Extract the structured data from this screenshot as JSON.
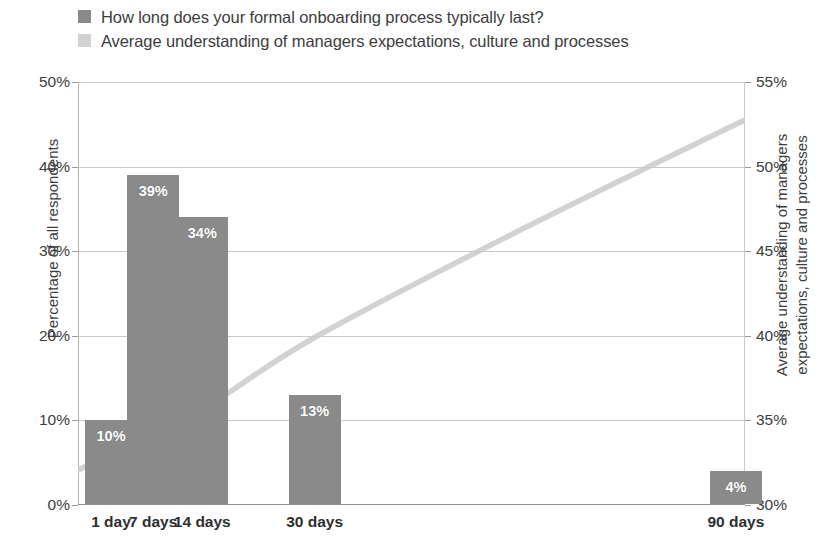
{
  "legend": {
    "items": [
      {
        "label": "How long does your formal onboarding process typically last?",
        "color": "#8a8a8a",
        "swatch": "bar-swatch"
      },
      {
        "label": "Average understanding of managers expectations, culture and processes",
        "color": "#d2d2d2",
        "swatch": "line-swatch"
      }
    ]
  },
  "axes": {
    "y_left": {
      "title": "Percentage of all respondents",
      "ticks": [
        "0%",
        "10%",
        "20%",
        "30%",
        "40%",
        "50%"
      ],
      "values": [
        0,
        10,
        20,
        30,
        40,
        50
      ],
      "min": 0,
      "max": 50
    },
    "y_right": {
      "title_line1": "Average understanding of managers expectations,",
      "title_line2": "culture and processes",
      "title": "Average understanding of managers expectations, culture and processes",
      "ticks": [
        "30%",
        "35%",
        "40%",
        "45%",
        "50%",
        "55%"
      ],
      "values": [
        30,
        35,
        40,
        45,
        50,
        55
      ],
      "min": 30,
      "max": 55
    },
    "x": {
      "ticks": [
        "1 day",
        "7 days",
        "14 days",
        "30 days",
        "90 days"
      ],
      "values": [
        1,
        7,
        14,
        30,
        90
      ]
    }
  },
  "chart_data": {
    "type": "bar",
    "title": "",
    "subtitle": "",
    "xlabel": "",
    "ylabel": "Percentage of all respondents",
    "y2label": "Average understanding of managers expectations, culture and processes",
    "categories": [
      "1 day",
      "7 days",
      "14 days",
      "30 days",
      "90 days"
    ],
    "x": [
      1,
      7,
      14,
      30,
      90
    ],
    "ylim": [
      0,
      50
    ],
    "y2lim": [
      30,
      55
    ],
    "grid": true,
    "legend_position": "top-left",
    "series": [
      {
        "name": "How long does your formal onboarding process typically last?",
        "type": "bar",
        "axis": "left",
        "color": "#8a8a8a",
        "values": [
          10,
          39,
          34,
          13,
          4
        ],
        "data_labels": [
          "10%",
          "39%",
          "34%",
          "13%",
          "4%"
        ]
      },
      {
        "name": "Average understanding of managers expectations, culture and processes",
        "type": "line",
        "axis": "right",
        "color": "#d2d2d2",
        "values": [
          33.0,
          34.2,
          35.6,
          39.9,
          52.5
        ],
        "curve_points": [
          [
            1,
            33.0
          ],
          [
            7,
            34.2
          ],
          [
            14,
            35.6
          ],
          [
            30,
            39.9
          ],
          [
            60,
            46.4
          ],
          [
            90,
            52.5
          ]
        ]
      }
    ]
  }
}
